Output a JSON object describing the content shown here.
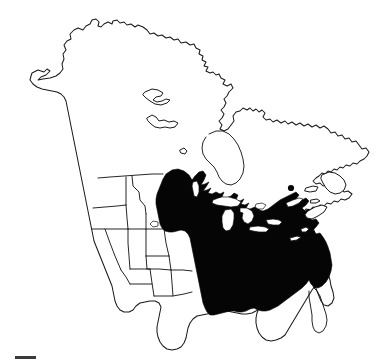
{
  "figure": {
    "title": "North America species distribution map",
    "type": "range-map",
    "background_color": "#ffffff",
    "outline_color": "#1a1a1a",
    "range_fill_color": "#050505",
    "lake_fill_color": "#ffffff",
    "width_px": 381,
    "height_px": 363
  },
  "map": {
    "projection_region": "North America",
    "base_outline_name": "north-america-coastline",
    "political_boundaries_shown": "western United States state boundaries, United States - Mexico border, United States - Canada border",
    "legend_items": [
      {
        "symbol": "solid-black-fill",
        "color": "#050505",
        "meaning": "shaded distribution range"
      }
    ]
  },
  "range": {
    "description": "Solid black shaded area covering the eastern United States and southeastern Canada",
    "northern_limit": "central Manitoba and Ontario, Canada",
    "western_limit": "eastern Great Plains, eastern Texas",
    "southern_limit": "Gulf of Mexico coast, excluding peninsular Florida",
    "eastern_limit": "Atlantic seaboard, Maritime Canada",
    "disjunct_marker": "isolated black dot near southern Quebec"
  },
  "features": {
    "unshaded_regions": [
      "Alaska",
      "western Canada",
      "Pacific Northwest",
      "California",
      "Great Basin",
      "Rocky Mountains",
      "Southwest",
      "western Texas",
      "peninsular Florida",
      "northern Canada",
      "Newfoundland"
    ],
    "lakes_shown_white": [
      "Lake Superior",
      "Lake Michigan",
      "Lake Huron",
      "Lake Erie",
      "Lake Ontario",
      "Lake Winnipeg"
    ],
    "water_bodies_outlined": [
      "Hudson Bay",
      "Gulf of St. Lawrence",
      "Gulf of Mexico"
    ]
  },
  "scale_bar": {
    "label": "",
    "visible": true,
    "color": "#3a3a3a"
  }
}
